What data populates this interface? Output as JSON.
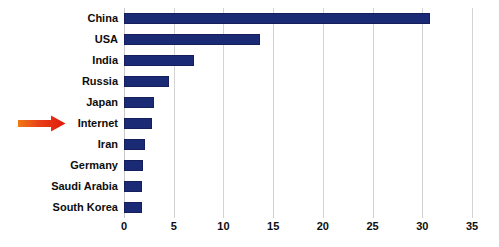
{
  "chart_data": {
    "type": "bar",
    "orientation": "horizontal",
    "title": "",
    "subtitle": "",
    "xlabel": "",
    "ylabel": "",
    "categories": [
      "China",
      "USA",
      "India",
      "Russia",
      "Japan",
      "Internet",
      "Iran",
      "Germany",
      "Saudi Arabia",
      "South Korea"
    ],
    "values": [
      30.8,
      13.7,
      7.0,
      4.5,
      3.0,
      2.8,
      2.1,
      1.9,
      1.8,
      1.8
    ],
    "xlim": [
      0,
      35
    ],
    "xticks": [
      0,
      5,
      10,
      15,
      20,
      25,
      30,
      35
    ],
    "xtick_labels": [
      "0",
      "5",
      "10",
      "15",
      "20",
      "25",
      "30",
      "35"
    ],
    "grid": "vertical",
    "legend": "none",
    "bar_color": "#1b2a75",
    "bar_edge_color": "#141f5c",
    "gridline_color": "#d3d3d3",
    "label_color": "#0d0d0d",
    "annotations": [
      {
        "type": "arrow",
        "target_category": "Internet",
        "direction": "right",
        "color": "#e8301a",
        "color_secondary": "#f5861f"
      }
    ]
  }
}
